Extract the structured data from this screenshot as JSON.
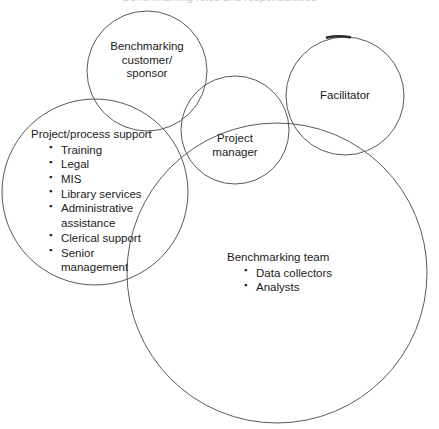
{
  "figure": {
    "kind": "venn-diagram",
    "stroke_color": "#5a5a5a",
    "text_color": "#1b1b1b",
    "background_color": "#ffffff",
    "cropped_title_remnant": "Benchmarking roles and responsibilities"
  },
  "circles": [
    {
      "id": "customer",
      "label": "Benchmarking customer/sponsor",
      "cx": 147,
      "cy": 71,
      "r": 60
    },
    {
      "id": "facilitator",
      "label": "Facilitator",
      "cx": 345,
      "cy": 96,
      "r": 59
    },
    {
      "id": "project-manager",
      "label": "Project manager",
      "cx": 235,
      "cy": 130,
      "r": 54
    },
    {
      "id": "support",
      "label": "Project/process support",
      "cx": 95,
      "cy": 192,
      "r": 93
    },
    {
      "id": "team",
      "label": "Benchmarking team",
      "cx": 277,
      "cy": 273,
      "r": 150
    }
  ],
  "labels": {
    "customer": {
      "line1": "Benchmarking",
      "line2": "customer/",
      "line3": "sponsor"
    },
    "facilitator": {
      "line1": "Facilitator"
    },
    "project_manager": {
      "line1": "Project",
      "line2": "manager"
    },
    "support": {
      "heading": "Project/process support",
      "items": [
        {
          "text": "Training",
          "bullet": true
        },
        {
          "text": "Legal",
          "bullet": true
        },
        {
          "text": "MIS",
          "bullet": true
        },
        {
          "text": "Library services",
          "bullet": true
        },
        {
          "text": "Administrative",
          "bullet": true
        },
        {
          "text": "assistance",
          "bullet": false
        },
        {
          "text": "Clerical support",
          "bullet": true
        },
        {
          "text": "Senior",
          "bullet": true
        },
        {
          "text": "management",
          "bullet": false
        }
      ]
    },
    "team": {
      "heading": "Benchmarking team",
      "items": [
        {
          "text": "Data collectors",
          "bullet": true
        },
        {
          "text": "Analysts",
          "bullet": true
        }
      ]
    }
  }
}
